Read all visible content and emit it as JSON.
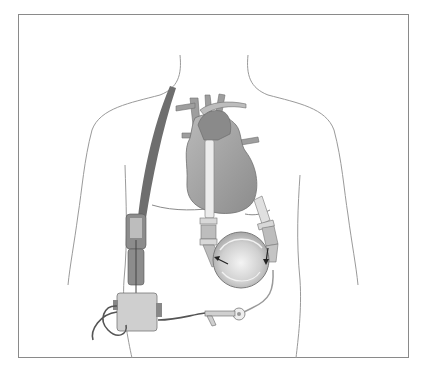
{
  "figure": {
    "colors": {
      "background": "#ffffff",
      "frame": "#8a8a8a",
      "body_outline": "#9a9a9a",
      "heart_fill": "#a8a8a8",
      "heart_dark": "#7a7a7a",
      "strap": "#6e6e6e",
      "cannula": "#e6e6e6",
      "pump": "#c9c9c9",
      "controller": "#cfcfcf",
      "cable": "#555555"
    }
  }
}
